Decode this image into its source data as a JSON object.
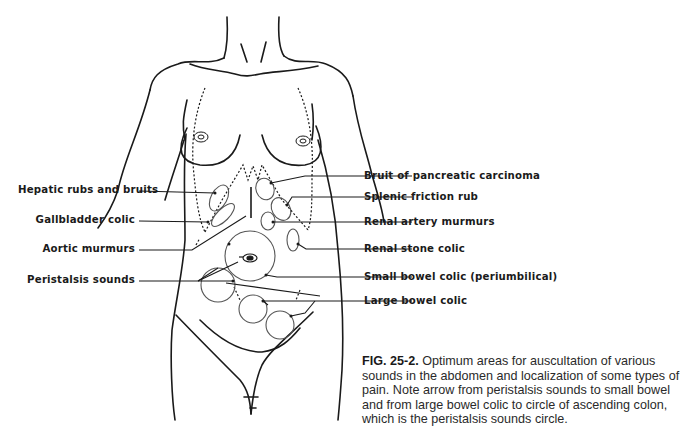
{
  "figure": {
    "number": "FIG. 25-2.",
    "caption": "Optimum areas for auscultation of various sounds in the abdomen and localization of some types of pain. Note arrow from peristalsis sounds to small bowel and from large bowel colic to circle of ascending colon, which is the peristalsis sounds circle."
  },
  "labels": {
    "left": [
      {
        "id": "hepatic",
        "text": "Hepatic rubs and bruits"
      },
      {
        "id": "gallbladder",
        "text": "Gallbladder colic"
      },
      {
        "id": "aortic",
        "text": "Aortic murmurs"
      },
      {
        "id": "peristalsis",
        "text": "Peristalsis sounds"
      }
    ],
    "right": [
      {
        "id": "pancreatic",
        "text": "Bruit of pancreatic carcinoma"
      },
      {
        "id": "splenic",
        "text": "Splenic friction rub"
      },
      {
        "id": "renal_artery",
        "text": "Renal artery murmurs"
      },
      {
        "id": "renal_stone",
        "text": "Renal stone colic"
      },
      {
        "id": "small_bowel",
        "text": "Small bowel colic (periumbilical)"
      },
      {
        "id": "large_bowel",
        "text": "Large bowel colic"
      }
    ]
  },
  "colors": {
    "ink": "#1a1a1a",
    "circle_stroke": "#555555",
    "background": "#ffffff"
  }
}
